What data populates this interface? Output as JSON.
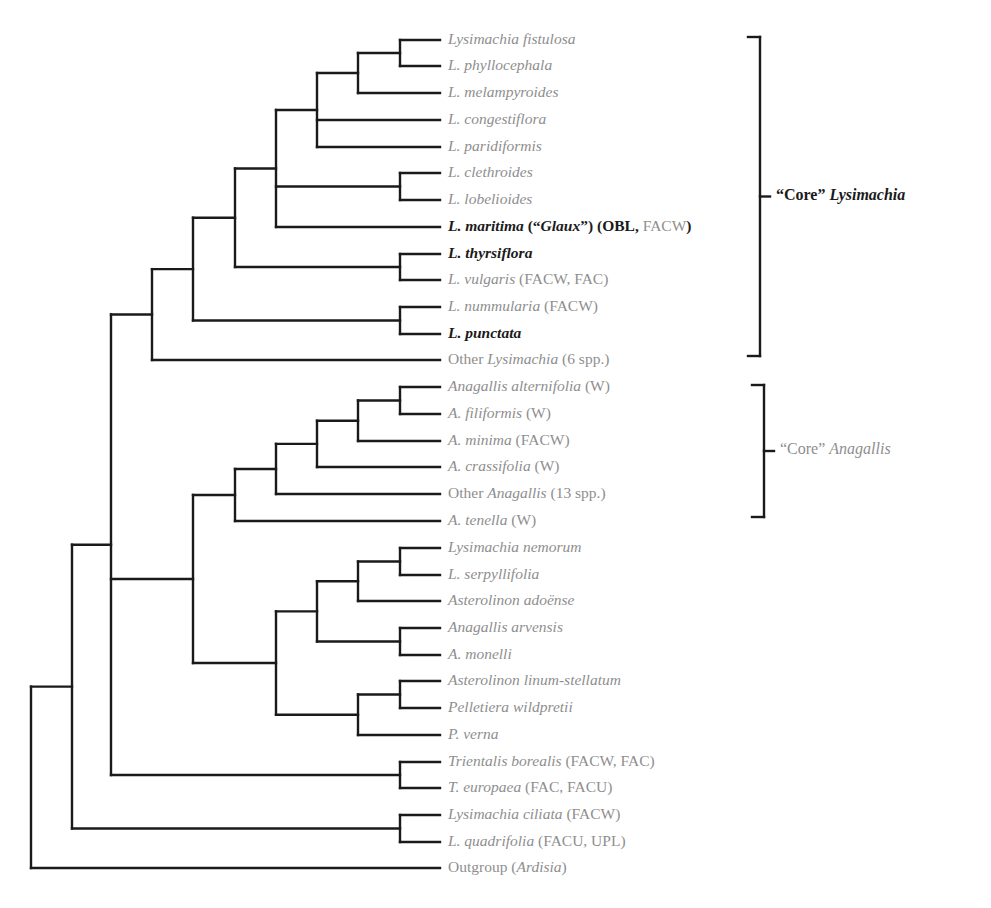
{
  "figure": {
    "type": "cladogram",
    "line_color": "#1a1a1a",
    "highlight_text_color": "#1a1a1a",
    "muted_text_color": "#8e8e8e"
  },
  "tips": [
    {
      "id": 0,
      "y": 40,
      "parts": [
        {
          "t": "Lysimachia fistulosa",
          "i": true
        }
      ],
      "bold": false
    },
    {
      "id": 1,
      "y": 66,
      "parts": [
        {
          "t": "L. phyllocephala",
          "i": true
        }
      ],
      "bold": false
    },
    {
      "id": 2,
      "y": 93,
      "parts": [
        {
          "t": "L. melampyroides",
          "i": true
        }
      ],
      "bold": false
    },
    {
      "id": 3,
      "y": 120,
      "parts": [
        {
          "t": "L. congestiflora",
          "i": true
        }
      ],
      "bold": false
    },
    {
      "id": 4,
      "y": 147,
      "parts": [
        {
          "t": "L. paridiformis",
          "i": true
        }
      ],
      "bold": false
    },
    {
      "id": 5,
      "y": 173,
      "parts": [
        {
          "t": "L. clethroides",
          "i": true
        }
      ],
      "bold": false
    },
    {
      "id": 6,
      "y": 200,
      "parts": [
        {
          "t": "L. lobelioides",
          "i": true
        }
      ],
      "bold": false
    },
    {
      "id": 7,
      "y": 227,
      "parts": [
        {
          "t": "L. maritima",
          "i": true
        },
        {
          "t": " (“"
        },
        {
          "t": "Glaux",
          "i": true
        },
        {
          "t": "”) (OBL, "
        },
        {
          "t": "FACW",
          "gray": true
        },
        {
          "t": ")"
        }
      ],
      "bold": true
    },
    {
      "id": 8,
      "y": 254,
      "parts": [
        {
          "t": "L. thyrsiflora",
          "i": true
        }
      ],
      "bold": true
    },
    {
      "id": 9,
      "y": 280,
      "parts": [
        {
          "t": "L. vulgaris",
          "i": true
        },
        {
          "t": " (FACW, FAC)"
        }
      ],
      "bold": false
    },
    {
      "id": 10,
      "y": 307,
      "parts": [
        {
          "t": "L. nummularia",
          "i": true
        },
        {
          "t": " (FACW)"
        }
      ],
      "bold": false
    },
    {
      "id": 11,
      "y": 334,
      "parts": [
        {
          "t": "L. punctata",
          "i": true
        }
      ],
      "bold": true
    },
    {
      "id": 12,
      "y": 360,
      "parts": [
        {
          "t": "Other "
        },
        {
          "t": "Lysimachia",
          "i": true
        },
        {
          "t": " (6 spp.)"
        }
      ],
      "bold": false
    },
    {
      "id": 13,
      "y": 387,
      "parts": [
        {
          "t": "Anagallis alternifolia",
          "i": true
        },
        {
          "t": " (W)"
        }
      ],
      "bold": false
    },
    {
      "id": 14,
      "y": 414,
      "parts": [
        {
          "t": "A. filiformis",
          "i": true
        },
        {
          "t": " (W)"
        }
      ],
      "bold": false
    },
    {
      "id": 15,
      "y": 441,
      "parts": [
        {
          "t": "A. minima",
          "i": true
        },
        {
          "t": " (FACW)"
        }
      ],
      "bold": false
    },
    {
      "id": 16,
      "y": 467,
      "parts": [
        {
          "t": "A. crassifolia",
          "i": true
        },
        {
          "t": " (W)"
        }
      ],
      "bold": false
    },
    {
      "id": 17,
      "y": 494,
      "parts": [
        {
          "t": "Other "
        },
        {
          "t": "Anagallis",
          "i": true
        },
        {
          "t": " (13 spp.)"
        }
      ],
      "bold": false
    },
    {
      "id": 18,
      "y": 521,
      "parts": [
        {
          "t": "A. tenella",
          "i": true
        },
        {
          "t": " (W)"
        }
      ],
      "bold": false
    },
    {
      "id": 19,
      "y": 548,
      "parts": [
        {
          "t": "Lysimachia nemorum",
          "i": true
        }
      ],
      "bold": false
    },
    {
      "id": 20,
      "y": 575,
      "parts": [
        {
          "t": "L. serpyllifolia",
          "i": true
        }
      ],
      "bold": false
    },
    {
      "id": 21,
      "y": 601,
      "parts": [
        {
          "t": "Asterolinon adoënse",
          "i": true
        }
      ],
      "bold": false
    },
    {
      "id": 22,
      "y": 628,
      "parts": [
        {
          "t": "Anagallis arvensis",
          "i": true
        }
      ],
      "bold": false
    },
    {
      "id": 23,
      "y": 655,
      "parts": [
        {
          "t": "A. monelli",
          "i": true
        }
      ],
      "bold": false
    },
    {
      "id": 24,
      "y": 681,
      "parts": [
        {
          "t": "Asterolinon linum-stellatum",
          "i": true
        }
      ],
      "bold": false
    },
    {
      "id": 25,
      "y": 708,
      "parts": [
        {
          "t": "Pelletiera wildpretii",
          "i": true
        }
      ],
      "bold": false
    },
    {
      "id": 26,
      "y": 735,
      "parts": [
        {
          "t": "P. verna",
          "i": true
        }
      ],
      "bold": false
    },
    {
      "id": 27,
      "y": 762,
      "parts": [
        {
          "t": "Trientalis borealis",
          "i": true
        },
        {
          "t": " (FACW, FAC)"
        }
      ],
      "bold": false
    },
    {
      "id": 28,
      "y": 788,
      "parts": [
        {
          "t": "T. europaea",
          "i": true
        },
        {
          "t": " (FAC, FACU)"
        }
      ],
      "bold": false
    },
    {
      "id": 29,
      "y": 815,
      "parts": [
        {
          "t": "Lysimachia ciliata",
          "i": true
        },
        {
          "t": " (FACW)"
        }
      ],
      "bold": false
    },
    {
      "id": 30,
      "y": 842,
      "parts": [
        {
          "t": "L. quadrifolia",
          "i": true
        },
        {
          "t": " (FACU, UPL)"
        }
      ],
      "bold": false
    },
    {
      "id": 31,
      "y": 868,
      "parts": [
        {
          "t": "Outgroup ("
        },
        {
          "t": "Ardisia",
          "i": true
        },
        {
          "t": ")"
        }
      ],
      "bold": false
    }
  ],
  "nodes": [
    {
      "x": 400,
      "children": [
        "t0",
        "t1"
      ]
    },
    {
      "x": 358,
      "children": [
        "n0",
        "t2"
      ]
    },
    {
      "x": 317,
      "children": [
        "n1",
        "t3",
        "t4"
      ]
    },
    {
      "x": 400,
      "children": [
        "t5",
        "t6"
      ]
    },
    {
      "x": 276,
      "children": [
        "n2",
        "n3",
        "t7"
      ]
    },
    {
      "x": 400,
      "children": [
        "t8",
        "t9"
      ]
    },
    {
      "x": 235,
      "children": [
        "n4",
        "n5"
      ]
    },
    {
      "x": 400,
      "children": [
        "t10",
        "t11"
      ]
    },
    {
      "x": 193,
      "children": [
        "n6",
        "n7"
      ]
    },
    {
      "x": 152,
      "children": [
        "n8",
        "t12"
      ]
    },
    {
      "x": 400,
      "children": [
        "t13",
        "t14"
      ]
    },
    {
      "x": 358,
      "children": [
        "n10",
        "t15"
      ]
    },
    {
      "x": 317,
      "children": [
        "n11",
        "t16"
      ]
    },
    {
      "x": 276,
      "children": [
        "n12",
        "t17"
      ]
    },
    {
      "x": 235,
      "children": [
        "n13",
        "t18"
      ]
    },
    {
      "x": 400,
      "children": [
        "t19",
        "t20"
      ]
    },
    {
      "x": 358,
      "children": [
        "n15",
        "t21"
      ]
    },
    {
      "x": 400,
      "children": [
        "t22",
        "t23"
      ]
    },
    {
      "x": 317,
      "children": [
        "n16",
        "n17"
      ]
    },
    {
      "x": 400,
      "children": [
        "t24",
        "t25"
      ]
    },
    {
      "x": 358,
      "children": [
        "n19",
        "t26"
      ]
    },
    {
      "x": 276,
      "children": [
        "n18",
        "n20"
      ]
    },
    {
      "x": 193,
      "children": [
        "n14",
        "n21"
      ]
    },
    {
      "x": 400,
      "children": [
        "t27",
        "t28"
      ]
    },
    {
      "x": 111,
      "children": [
        "n9",
        "n22",
        "n23"
      ]
    },
    {
      "x": 400,
      "children": [
        "t29",
        "t30"
      ]
    },
    {
      "x": 72,
      "children": [
        "n24",
        "n25"
      ]
    },
    {
      "x": 31,
      "children": [
        "n26",
        "t31"
      ]
    }
  ],
  "tip_x": 440,
  "clades": [
    {
      "name": "core-lysimachia",
      "bracket": {
        "x": 760,
        "y1": 37,
        "y2": 356
      },
      "label_parts": [
        {
          "t": "“Core” "
        },
        {
          "t": "Lysimachia",
          "i": true
        }
      ],
      "style": "bold"
    },
    {
      "name": "core-anagallis",
      "bracket": {
        "x": 764,
        "y1": 385,
        "y2": 517
      },
      "label_parts": [
        {
          "t": "“Core” "
        },
        {
          "t": "Anagallis",
          "i": true
        }
      ],
      "style": "gray"
    }
  ]
}
